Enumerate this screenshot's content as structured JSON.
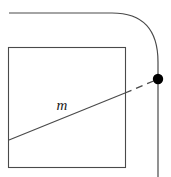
{
  "figure": {
    "width": 171,
    "height": 177,
    "background_color": "#ffffff",
    "stroke_color": "#4a4a4a",
    "dash_color": "#4a4a4a",
    "dot_color": "#000000",
    "label_color": "#1a1a1a"
  },
  "labels": {
    "slope_line": "m"
  },
  "shapes": {
    "square": {
      "name": "square-outline",
      "x": 8.5,
      "y": 47.5,
      "width": 117,
      "height": 120,
      "stroke_width": 1.1
    },
    "rounded_path": {
      "name": "rounded-corner-path",
      "start": [
        9,
        13
      ],
      "curve_start": [
        112,
        13
      ],
      "control": [
        158,
        13
      ],
      "curve_end": [
        158,
        62
      ],
      "end": [
        158,
        177
      ],
      "stroke_width": 1.2
    },
    "solid_line": {
      "name": "line-m-solid",
      "from": [
        9,
        140
      ],
      "to": [
        125,
        93
      ],
      "stroke_width": 1.2
    },
    "dashed_line": {
      "name": "line-m-dashed-extension",
      "from": [
        125,
        93
      ],
      "to": [
        156,
        80
      ],
      "stroke_width": 1.3,
      "dash_pattern": "7,5"
    },
    "point": {
      "name": "intersection-point",
      "cx": 158,
      "cy": 79,
      "r": 5.2
    }
  },
  "label_positions": {
    "slope_line": {
      "x": 62,
      "y": 110
    }
  }
}
